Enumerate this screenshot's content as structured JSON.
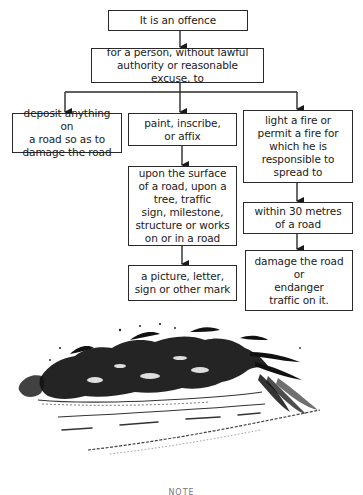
{
  "flowchart": {
    "root": "It is an offence",
    "condition": "for a person, without lawful\nauthority or reasonable excuse, to",
    "branches": {
      "left": {
        "action": "deposit anything on\na road so as to\ndamage the road"
      },
      "middle": {
        "action": "paint, inscribe,\nor affix",
        "location": "upon the surface\nof a road, upon a\ntree, traffic\nsign, milestone,\nstructure or works\non or in a road",
        "object": "a picture, letter,\nsign or other mark"
      },
      "right": {
        "action": "light a fire or\npermit a fire for\nwhich he is\nresponsible to\nspread to",
        "distance": "within 30 metres\nof a road",
        "consequence": "damage the road\nor\nendanger\ntraffic on it."
      }
    }
  },
  "illustration": {
    "subject": "roadside hedge and vegetation beside a road with dashed centre line"
  },
  "footer": {
    "note_label": "NOTE"
  },
  "colors": {
    "line": "#2a2a2a",
    "background": "#ffffff",
    "ink": "#1a1a1a"
  }
}
